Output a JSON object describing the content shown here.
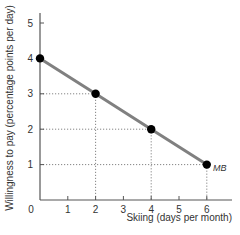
{
  "chart_data": {
    "type": "line",
    "title": "",
    "xlabel": "Skiing (days per month)",
    "ylabel": "Willingness to pay (percentage points per day)",
    "x_ticks": [
      0,
      1,
      2,
      3,
      4,
      5,
      6
    ],
    "y_ticks": [
      0,
      1,
      2,
      3,
      4,
      5
    ],
    "xlim": [
      0,
      7
    ],
    "ylim": [
      0,
      5.3
    ],
    "grid": false,
    "series": [
      {
        "name": "MB",
        "color": "#808080",
        "points": [
          {
            "x": 0,
            "y": 4
          },
          {
            "x": 2,
            "y": 3
          },
          {
            "x": 4,
            "y": 2
          },
          {
            "x": 6,
            "y": 1
          }
        ]
      }
    ],
    "guides": "dotted lines from marked points to both axes",
    "annotations": [
      {
        "text": "MB",
        "x": 6,
        "y": 1
      }
    ]
  },
  "labels": {
    "x_axis": "Skiing (days per month)",
    "y_axis": "Willingness to pay (percentage points per day)",
    "series": "MB",
    "origin": "0",
    "x_ticks": [
      "1",
      "2",
      "3",
      "4",
      "5",
      "6"
    ],
    "y_ticks": [
      "1",
      "2",
      "3",
      "4",
      "5"
    ]
  }
}
